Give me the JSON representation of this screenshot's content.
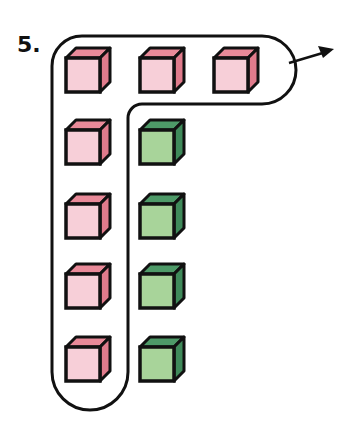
{
  "problem": {
    "number_label": "5."
  },
  "colors": {
    "pink_front": "#f7cfd8",
    "pink_top": "#e98a99",
    "pink_side": "#e07b8c",
    "green_front": "#a8d49a",
    "green_top": "#4e9a68",
    "green_side": "#3f8a5a",
    "outline": "#111111"
  },
  "cubes": {
    "row1": [
      "pink",
      "pink",
      "pink"
    ],
    "row2": [
      "pink",
      "green"
    ],
    "row3": [
      "pink",
      "green"
    ],
    "row4": [
      "pink",
      "green"
    ],
    "row5": [
      "pink",
      "green"
    ]
  },
  "grouping": {
    "description": "L-shaped loop encloses the top row of 3 pink cubes and the left column of pink cubes (7 pink cubes); an arrow points out to the right",
    "enclosed_count": 7,
    "outside_count": 4
  }
}
